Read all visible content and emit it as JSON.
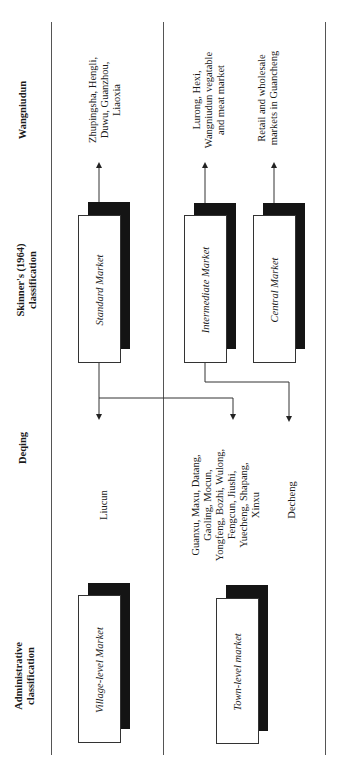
{
  "figure": {
    "orientation": "rotated-90-ccw",
    "columns": [
      {
        "id": "administrative",
        "header": "Administrative\nclassification"
      },
      {
        "id": "deqing",
        "header": "Deqing"
      },
      {
        "id": "skinner",
        "header": "Skinner's (1964)\nclassification"
      },
      {
        "id": "wangniudun",
        "header": "Wangniudun"
      }
    ],
    "rows": [
      {
        "id": "row-standard",
        "administrative_box": "Village-level Market",
        "deqing": "Liucun",
        "skinner_box": "Standard Market",
        "wangniudun": "Zhupingsha, Hengli,\nDuwu, Guanzhou,\nLiaoxia"
      },
      {
        "id": "row-intermediate-central",
        "administrative_box": "Town-level market",
        "deqing_a": "Guanxu, Maxu, Datang,\nGaoling, Mocun,\nYongfeng, Bozhi, Wulong,\nFengcun, Jiushi,\nYuecheng, Shapang,\nXinxu",
        "deqing_b": "Decheng",
        "skinner_box_a": "Intermediate Market",
        "skinner_box_b": "Central Market",
        "wangniudun_a": "Lurong, Hexi,\nWangniudun vegatable\nand meat market",
        "wangniudun_b": "Retail and wholesale\nmarkets in Guancheng"
      }
    ],
    "connections": [
      {
        "from": "Standard Market",
        "to": "Zhupingsha, Hengli, Duwu, Guanzhou, Liaoxia"
      },
      {
        "from": "Intermediate Market",
        "to": "Lurong, Hexi, Wangniudun vegatable and meat market"
      },
      {
        "from": "Central Market",
        "to": "Retail and wholesale markets in Guancheng"
      },
      {
        "from": "Standard Market",
        "to": "Liucun"
      },
      {
        "from": "Standard Market",
        "to": "Guanxu, Maxu, Datang, ..."
      },
      {
        "from": "Intermediate Market",
        "to": "Decheng"
      }
    ],
    "colors": {
      "line": "#555555",
      "shadow": "#141414",
      "box": "#ffffff"
    }
  }
}
